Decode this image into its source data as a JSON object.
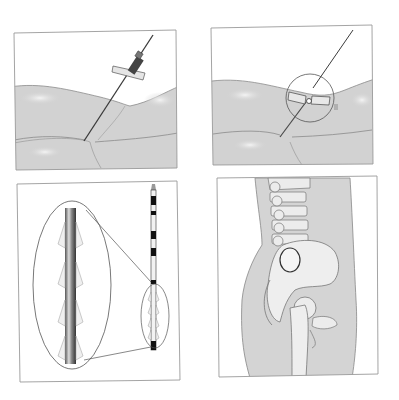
{
  "figure": {
    "panels": [
      {
        "id": "needle-insertion",
        "position": "top-left"
      },
      {
        "id": "needle-hub-magnified",
        "position": "top-right"
      },
      {
        "id": "catheter-detail",
        "position": "bottom-left"
      },
      {
        "id": "pelvis-lateral",
        "position": "bottom-right"
      }
    ],
    "colors": {
      "background": "#ffffff",
      "panel_border": "#9a9a9a",
      "skin_fill": "#cfcfcf",
      "skin_highlight": "#e8e8e8",
      "skin_line": "#8a8a8a",
      "needle": "#3a3a3a",
      "bone": "#ececec",
      "bone_line": "#7a7a7a",
      "catheter_mark": "#111111"
    }
  }
}
